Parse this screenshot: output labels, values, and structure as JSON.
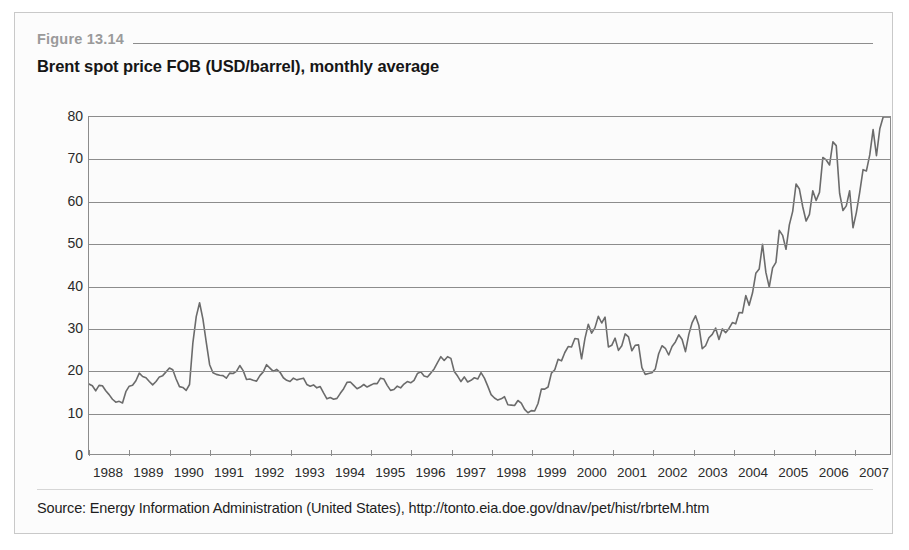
{
  "figure": {
    "label": "Figure 13.14",
    "title": "Brent spot price FOB (USD/barrel), monthly average",
    "source": "Source: Energy Information Administration (United States), http://tonto.eia.doe.gov/dnav/pet/hist/rbrteM.htm"
  },
  "colors": {
    "line": "#6b6b6b",
    "grid": "#8c8c8c",
    "frame": "#c9c9c9",
    "label_gray": "#9a9a9a",
    "text": "#1e1e1e",
    "plot_bg": "#fbfbfb"
  },
  "chart_data": {
    "type": "line",
    "title": "Brent spot price FOB (USD/barrel), monthly average",
    "xlabel": "",
    "ylabel": "",
    "ylim": [
      0,
      80
    ],
    "yticks": [
      0,
      10,
      20,
      30,
      40,
      50,
      60,
      70,
      80
    ],
    "xlim": [
      1988,
      2007.92
    ],
    "xticks": [
      1988,
      1989,
      1990,
      1991,
      1992,
      1993,
      1994,
      1995,
      1996,
      1997,
      1998,
      1999,
      2000,
      2001,
      2002,
      2003,
      2004,
      2005,
      2006,
      2007
    ],
    "xtick_labels": [
      "1988",
      "1989",
      "1990",
      "1991",
      "1992",
      "1993",
      "1994",
      "1995",
      "1996",
      "1997",
      "1998",
      "1999",
      "2000",
      "2001",
      "2002",
      "2003",
      "2004",
      "2005",
      "2006",
      "2007"
    ],
    "grid": "horizontal",
    "legend": "none",
    "units": "USD/barrel",
    "frequency": "monthly",
    "series": [
      {
        "name": "Brent spot price FOB (USD/barrel)",
        "x_start": 1988.0,
        "x_step": 0.0833333,
        "values": [
          16.6,
          16.2,
          15.0,
          16.3,
          16.2,
          15.0,
          14.1,
          13.0,
          12.3,
          12.5,
          12.1,
          14.8,
          16.1,
          16.3,
          17.4,
          19.2,
          18.4,
          18.1,
          17.2,
          16.4,
          17.2,
          18.3,
          18.6,
          19.5,
          20.4,
          20.0,
          17.8,
          16.0,
          15.8,
          15.1,
          16.5,
          26.4,
          32.6,
          35.9,
          32.0,
          26.5,
          21.2,
          19.3,
          18.9,
          18.7,
          18.6,
          18.0,
          19.2,
          19.1,
          19.6,
          21.0,
          19.8,
          17.7,
          17.8,
          17.5,
          17.3,
          18.6,
          19.5,
          21.2,
          20.4,
          19.6,
          20.1,
          19.4,
          18.1,
          17.5,
          17.2,
          18.0,
          17.6,
          17.8,
          18.0,
          16.5,
          16.1,
          16.4,
          15.7,
          16.0,
          14.5,
          13.1,
          13.4,
          13.0,
          13.2,
          14.4,
          15.5,
          17.0,
          17.1,
          16.3,
          15.5,
          15.9,
          16.5,
          15.9,
          16.3,
          16.7,
          16.7,
          18.0,
          17.8,
          16.3,
          15.1,
          15.3,
          16.1,
          15.7,
          16.6,
          17.2,
          16.9,
          17.5,
          19.1,
          19.5,
          18.5,
          18.3,
          19.2,
          20.2,
          21.7,
          23.1,
          22.2,
          23.1,
          22.7,
          19.6,
          18.5,
          17.2,
          18.3,
          17.1,
          17.5,
          18.1,
          17.8,
          19.3,
          18.0,
          16.1,
          14.1,
          13.3,
          12.8,
          13.1,
          13.6,
          11.7,
          11.6,
          11.5,
          12.7,
          12.1,
          10.6,
          9.8,
          10.3,
          10.2,
          12.0,
          15.4,
          15.4,
          15.9,
          19.2,
          20.0,
          22.5,
          22.1,
          24.1,
          25.5,
          25.4,
          27.4,
          27.3,
          22.6,
          27.4,
          30.8,
          28.7,
          30.0,
          32.7,
          31.1,
          32.5,
          25.4,
          25.8,
          27.5,
          24.6,
          25.7,
          28.5,
          27.8,
          24.5,
          25.8,
          25.9,
          20.5,
          18.9,
          19.1,
          19.3,
          20.2,
          23.8,
          25.7,
          25.1,
          23.5,
          25.5,
          26.6,
          28.3,
          27.2,
          24.3,
          28.4,
          31.2,
          32.8,
          30.5,
          25.0,
          25.7,
          27.6,
          28.4,
          29.9,
          27.2,
          29.7,
          28.8,
          29.8,
          31.2,
          30.9,
          33.6,
          33.5,
          37.6,
          35.3,
          38.2,
          42.9,
          43.9,
          49.8,
          43.1,
          39.6,
          44.2,
          45.5,
          53.1,
          51.9,
          48.6,
          54.4,
          57.6,
          64.1,
          62.9,
          58.7,
          55.3,
          56.9,
          62.5,
          60.2,
          62.1,
          70.4,
          69.8,
          68.6,
          74.1,
          73.2,
          61.9,
          57.8,
          58.9,
          62.5,
          53.7,
          57.3,
          62.1,
          67.5,
          67.2,
          71.0,
          77.0,
          70.8,
          77.2,
          82.3,
          92.4,
          90.9
        ]
      }
    ],
    "annotations": [
      {
        "text": "Gulf War spike",
        "approx_x": 1990.8,
        "approx_y": 36
      },
      {
        "text": "1998 trough",
        "approx_x": 1998.9,
        "approx_y": 10
      },
      {
        "text": "2006 peak",
        "approx_x": 2006.6,
        "approx_y": 74
      }
    ]
  }
}
